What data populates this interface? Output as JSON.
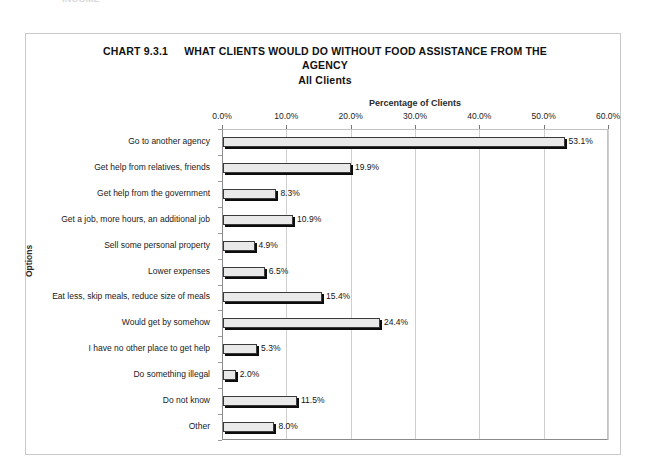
{
  "scan_fragment": "INCOME",
  "title": {
    "chart_number": "CHART 9.3.1",
    "line1": "WHAT CLIENTS WOULD DO WITHOUT FOOD ASSISTANCE FROM THE",
    "line2": "AGENCY",
    "line3": "All Clients"
  },
  "chart_data": {
    "type": "bar",
    "orientation": "horizontal",
    "subtitle": "All Clients",
    "xlabel": "Percentage of Clients",
    "ylabel": "Options",
    "xlim": [
      0,
      60
    ],
    "xtick_labels": [
      "0.0%",
      "10.0%",
      "20.0%",
      "30.0%",
      "40.0%",
      "50.0%",
      "60.0%"
    ],
    "xticks": [
      0,
      10,
      20,
      30,
      40,
      50,
      60
    ],
    "grid": true,
    "legend": false,
    "bar_fill_color": "#e9e9e9",
    "bar_edge_color": "#3a3a3a",
    "bar_shadow_color": "#0c0c0c",
    "categories": [
      "Go to another agency",
      "Get help from relatives, friends",
      "Get help from the government",
      "Get a job, more hours, an additional job",
      "Sell some personal property",
      "Lower expenses",
      "Eat less, skip meals, reduce size of meals",
      "Would get by somehow",
      "I have no other place to get help",
      "Do something illegal",
      "Do not know",
      "Other"
    ],
    "values": [
      53.1,
      19.9,
      8.3,
      10.9,
      4.9,
      6.5,
      15.4,
      24.4,
      5.3,
      2.0,
      11.5,
      8.0
    ],
    "value_labels": [
      "53.1%",
      "19.9%",
      "8.3%",
      "10.9%",
      "4.9%",
      "6.5%",
      "15.4%",
      "24.4%",
      "5.3%",
      "2.0%",
      "11.5%",
      "8.0%"
    ]
  }
}
